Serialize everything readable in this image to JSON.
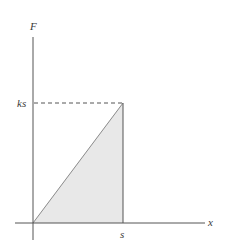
{
  "diagram": {
    "type": "force-displacement-graph",
    "axes": {
      "y_label": "F",
      "x_label": "x"
    },
    "markers": {
      "y_value_label": "ks",
      "x_value_label": "s"
    },
    "shaded_region": "triangle under line F = kx from 0 to s",
    "colors": {
      "axis": "#555555",
      "line": "#777777",
      "fill": "#e6e6e6",
      "dashed": "#555555"
    }
  }
}
